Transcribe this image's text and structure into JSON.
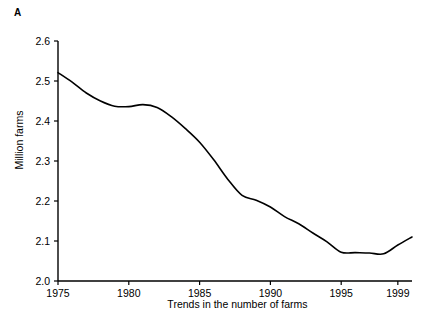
{
  "figure": {
    "panel_label": "A",
    "top_fragment": "",
    "xlabel": "Trends in the number of farms",
    "ylabel": "Million farms"
  },
  "chart_data": {
    "type": "line",
    "title": "",
    "subtitle": "",
    "xlabel": "Trends in the number of farms",
    "ylabel": "Million farms",
    "xlim": [
      1975,
      2000
    ],
    "ylim": [
      2.0,
      2.6
    ],
    "grid": false,
    "legend": false,
    "legend_position": "none",
    "x_ticks": [
      1975,
      1980,
      1985,
      1990,
      1995,
      1999
    ],
    "x_tick_labels": [
      "1975",
      "1980",
      "1985",
      "1990",
      "1995",
      "1999"
    ],
    "y_ticks": [
      2.0,
      2.1,
      2.2,
      2.3,
      2.4,
      2.5,
      2.6
    ],
    "y_tick_labels": [
      "2.0",
      "2.1",
      "2.2",
      "2.3",
      "2.4",
      "2.5",
      "2.6"
    ],
    "line_color": "#000000",
    "line_width": 1.6,
    "markers": "none",
    "x": [
      1975,
      1976,
      1977,
      1978,
      1979,
      1980,
      1981,
      1982,
      1983,
      1984,
      1985,
      1986,
      1987,
      1988,
      1989,
      1990,
      1991,
      1992,
      1993,
      1994,
      1995,
      1996,
      1997,
      1998,
      1999,
      2000
    ],
    "series": [
      {
        "name": "Number of farms",
        "units": "million farms",
        "values": [
          2.521,
          2.497,
          2.47,
          2.45,
          2.437,
          2.436,
          2.441,
          2.434,
          2.411,
          2.381,
          2.347,
          2.303,
          2.254,
          2.214,
          2.202,
          2.185,
          2.161,
          2.143,
          2.12,
          2.098,
          2.072,
          2.071,
          2.07,
          2.068,
          2.09,
          2.11
        ]
      }
    ],
    "annotations": []
  },
  "axes": {
    "spines": {
      "left": true,
      "bottom": true,
      "top": false,
      "right": false
    },
    "spine_color": "#000000"
  }
}
